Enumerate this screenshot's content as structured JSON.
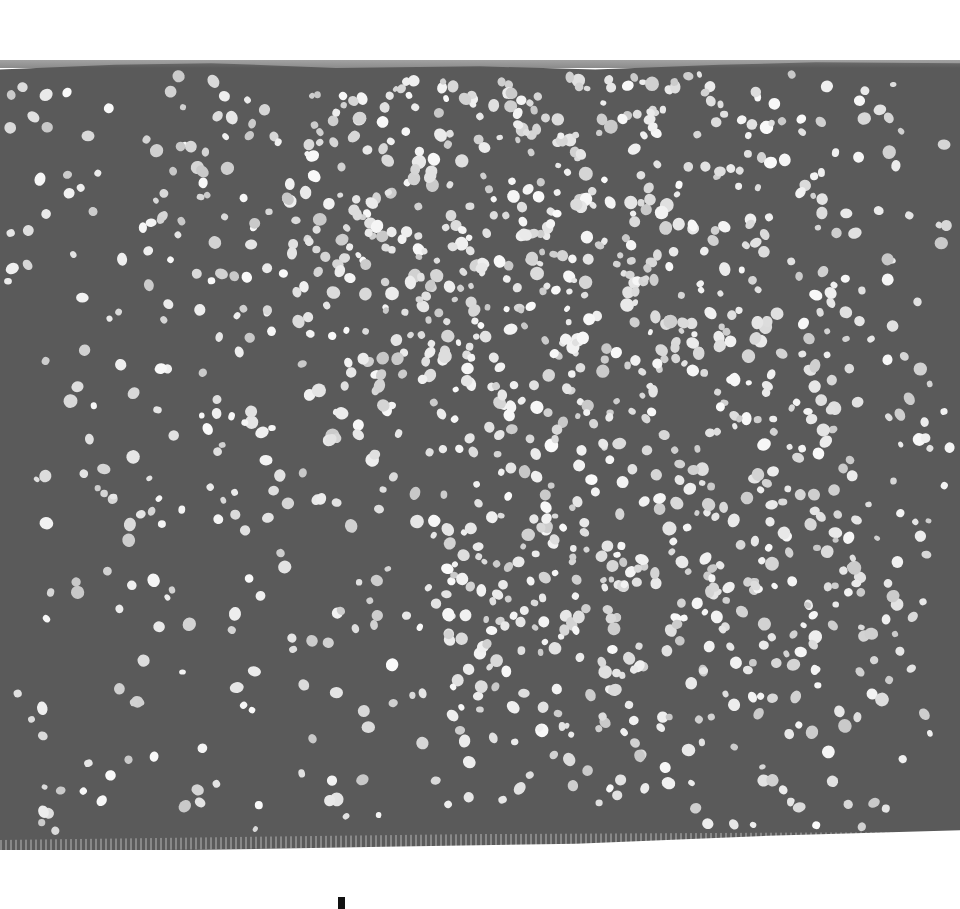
{
  "artwork": {
    "canvas_color": "#5a5a5a",
    "dot_color": "#e6e6e6",
    "background_color": "#ffffff",
    "dot_density_center": {
      "x": 510,
      "y": 240
    },
    "dot_count": 1300
  },
  "bottom_mark": {
    "color": "#111111"
  }
}
